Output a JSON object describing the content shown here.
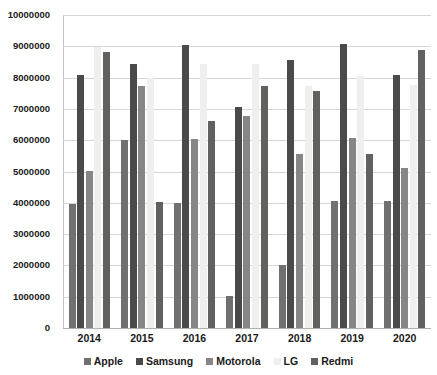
{
  "chart_data": {
    "type": "bar",
    "title": "",
    "xlabel": "",
    "ylabel": "",
    "ylim": [
      0,
      10000000
    ],
    "ytick_step": 1000000,
    "grid": true,
    "legend_position": "bottom",
    "categories": [
      "2014",
      "2015",
      "2016",
      "2017",
      "2018",
      "2019",
      "2020"
    ],
    "ytick_labels": [
      "10000000",
      "9000000",
      "8000000",
      "7000000",
      "6000000",
      "5000000",
      "4000000",
      "3000000",
      "2000000",
      "1000000",
      "0"
    ],
    "series": [
      {
        "name": "Apple",
        "color": "#70706f",
        "values": [
          3970000,
          6000000,
          4000000,
          1020000,
          2020000,
          4050000,
          4050000
        ]
      },
      {
        "name": "Samsung",
        "color": "#4a4a4a",
        "values": [
          8080000,
          8420000,
          9030000,
          7050000,
          8560000,
          9060000,
          8090000
        ]
      },
      {
        "name": "Motorola",
        "color": "#868686",
        "values": [
          5010000,
          7720000,
          6050000,
          6780000,
          5570000,
          6080000,
          5110000
        ]
      },
      {
        "name": "LG",
        "color": "#efefed",
        "values": [
          8990000,
          8000000,
          8420000,
          8450000,
          7740000,
          8060000,
          7760000
        ]
      },
      {
        "name": "Redmi",
        "color": "#616160",
        "values": [
          8810000,
          4020000,
          6620000,
          7740000,
          7560000,
          5570000,
          8880000
        ]
      }
    ]
  }
}
